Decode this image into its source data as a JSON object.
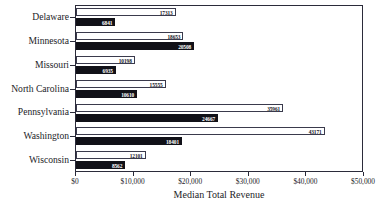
{
  "chart_data": {
    "type": "bar",
    "orientation": "horizontal",
    "title": "",
    "xlabel": "Median Total Revenue",
    "ylabel": "",
    "xlim": [
      0,
      50000
    ],
    "grid": false,
    "legend": "none",
    "xticks": [
      0,
      10000,
      20000,
      30000,
      40000,
      50000
    ],
    "xticklabels": [
      "$0",
      "$10,000",
      "$20,000",
      "$30,000",
      "$40,000",
      "$50,000"
    ],
    "categories": [
      "Delaware",
      "Minnesota",
      "Missouri",
      "North Carolina",
      "Pennsylvania",
      "Washington",
      "Wisconsin"
    ],
    "series": [
      {
        "name": "upper-bar",
        "style": "light",
        "values": [
          17313,
          18653,
          10198,
          15555,
          35961,
          43171,
          12101
        ],
        "labels": [
          "17313",
          "18653",
          "10198",
          "15555",
          "35961",
          "43171",
          "12101"
        ]
      },
      {
        "name": "lower-bar",
        "style": "dark",
        "values": [
          6841,
          20508,
          6935,
          10610,
          24667,
          18401,
          8562
        ],
        "labels": [
          "6841",
          "20508",
          "6935",
          "10610",
          "24667",
          "18401",
          "8562"
        ]
      }
    ]
  },
  "colors": {
    "axis": "#2b2b3a",
    "light_bar_fill": "#ffffff",
    "light_bar_edge": "#3a3a4c",
    "dark_bar_fill": "#111118",
    "text": "#1d1d28"
  }
}
